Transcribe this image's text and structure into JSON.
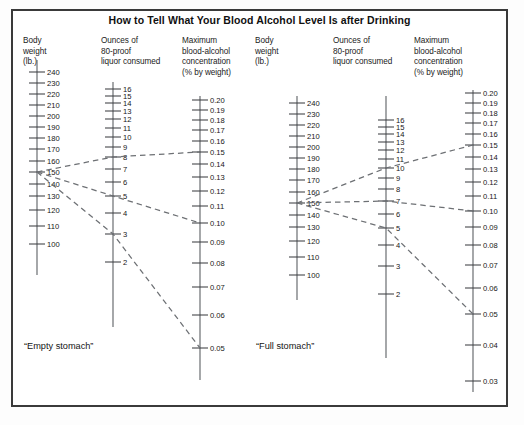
{
  "title": "How to Tell What Your Blood Alcohol Level Is after Drinking",
  "panels": [
    {
      "key": "empty",
      "caption": "“Empty stomach”",
      "columns": [
        {
          "key": "weight",
          "header": "Body\nweight\n(lb.)"
        },
        {
          "key": "ounces",
          "header": "Ounces of\n80-proof\nliquor consumed"
        },
        {
          "key": "bac",
          "header": "Maximum\nblood-alcohol\nconcentration\n(% by weight)"
        }
      ]
    },
    {
      "key": "full",
      "caption": "“Full stomach”",
      "columns": [
        {
          "key": "weight",
          "header": "Body\nweight\n(lb.)"
        },
        {
          "key": "ounces",
          "header": "Ounces of\n80-proof\nliquor consumed"
        },
        {
          "key": "bac",
          "header": "Maximum\nblood-alcohol\nconcentration\n(% by weight)"
        }
      ]
    }
  ],
  "chart_data": {
    "type": "line",
    "chart_subtype": "nomogram",
    "title": "How to Tell What Your Blood Alcohol Level Is after Drinking",
    "xlabel": "",
    "ylabel": "",
    "grid": false,
    "legend": null,
    "panels": [
      {
        "name": "“Empty stomach”",
        "scales": [
          {
            "name": "Body weight (lb.)",
            "unit": "lb.",
            "ticks": [
              240,
              230,
              220,
              210,
              200,
              190,
              180,
              170,
              160,
              150,
              140,
              130,
              120,
              110,
              100
            ],
            "labels": [
              "240",
              "230",
              "220",
              "210",
              "200",
              "190",
              "180",
              "170",
              "160",
              "150",
              "140",
              "130",
              "120",
              "110",
              "100"
            ],
            "range": [
              100,
              240
            ],
            "pivot_value": 150
          },
          {
            "name": "Ounces of 80-proof liquor consumed",
            "unit": "oz",
            "ticks": [
              16,
              15,
              14,
              13,
              12,
              11,
              10,
              9,
              8,
              7,
              6,
              5,
              4,
              3,
              2
            ],
            "labels": [
              "16",
              "15",
              "14",
              "13",
              "12",
              "11",
              "10",
              "9",
              "8",
              "7",
              "6",
              "5",
              "4",
              "3",
              "2"
            ],
            "range": [
              2,
              16
            ]
          },
          {
            "name": "Maximum blood-alcohol concentration (% by weight)",
            "unit": "% by weight",
            "ticks": [
              0.2,
              0.19,
              0.18,
              0.17,
              0.16,
              0.15,
              0.14,
              0.13,
              0.12,
              0.11,
              0.1,
              0.09,
              0.08,
              0.07,
              0.06,
              0.05
            ],
            "labels": [
              "0.20",
              "0.19",
              "0.18",
              "0.17",
              "0.16",
              "0.15",
              "0.14",
              "0.13",
              "0.12",
              "0.11",
              "0.10",
              "0.09",
              "0.08",
              "0.07",
              "0.06",
              "0.05"
            ],
            "range": [
              0.05,
              0.2
            ]
          }
        ],
        "guide_lines": [
          {
            "weight_lb": 150,
            "ounces": 8,
            "bac": 0.15
          },
          {
            "weight_lb": 150,
            "ounces": 5,
            "bac": 0.1
          },
          {
            "weight_lb": 150,
            "ounces": 3,
            "bac": 0.05
          }
        ]
      },
      {
        "name": "“Full stomach”",
        "scales": [
          {
            "name": "Body weight (lb.)",
            "unit": "lb.",
            "ticks": [
              240,
              230,
              220,
              210,
              200,
              190,
              180,
              170,
              160,
              150,
              140,
              130,
              120,
              110,
              100
            ],
            "labels": [
              "240",
              "230",
              "220",
              "210",
              "200",
              "190",
              "180",
              "170",
              "160",
              "150",
              "140",
              "130",
              "120",
              "110",
              "100"
            ],
            "range": [
              100,
              240
            ],
            "pivot_value": 150
          },
          {
            "name": "Ounces of 80-proof liquor consumed",
            "unit": "oz",
            "ticks": [
              16,
              15,
              14,
              13,
              12,
              11,
              10,
              9,
              8,
              7,
              6,
              5,
              4,
              3,
              2
            ],
            "labels": [
              "16",
              "15",
              "14",
              "13",
              "12",
              "11",
              "10",
              "9",
              "8",
              "7",
              "6",
              "5",
              "4",
              "3",
              "2"
            ],
            "range": [
              2,
              16
            ]
          },
          {
            "name": "Maximum blood-alcohol concentration (% by weight)",
            "unit": "% by weight",
            "ticks": [
              0.2,
              0.19,
              0.18,
              0.17,
              0.16,
              0.15,
              0.14,
              0.13,
              0.12,
              0.11,
              0.1,
              0.09,
              0.08,
              0.07,
              0.06,
              0.05,
              0.04,
              0.03
            ],
            "labels": [
              "0.20",
              "0.19",
              "0.18",
              "0.17",
              "0.16",
              "0.15",
              "0.14",
              "0.13",
              "0.12",
              "0.11",
              "0.10",
              "0.09",
              "0.08",
              "0.07",
              "0.06",
              "0.05",
              "0.04",
              "0.03"
            ],
            "range": [
              0.03,
              0.2
            ]
          }
        ],
        "guide_lines": [
          {
            "weight_lb": 150,
            "ounces": 10,
            "bac": 0.15
          },
          {
            "weight_lb": 150,
            "ounces": 7,
            "bac": 0.1
          },
          {
            "weight_lb": 150,
            "ounces": 5,
            "bac": 0.05
          }
        ]
      }
    ]
  },
  "geometry": {
    "panels": [
      {
        "key": "empty",
        "caption_pos": {
          "x": 24,
          "y": 341
        },
        "headers": [
          {
            "x": 23,
            "y": 36
          },
          {
            "x": 101,
            "y": 36
          },
          {
            "x": 182,
            "y": 36
          }
        ],
        "axes": [
          {
            "key": "weight",
            "x": 37,
            "top": 66,
            "bottom": 190,
            "tick_half": 8,
            "label_dx": 10,
            "label_dy": 2.6,
            "values": [
              240,
              230,
              220,
              210,
              200,
              190,
              180,
              170,
              160,
              150,
              140,
              130,
              120,
              110,
              100
            ],
            "ys": [
              72,
              83,
              94,
              105,
              116,
              127,
              138,
              149,
              161,
              172,
              184,
              196,
              210,
              226,
              244
            ],
            "labels": [
              "240",
              "230",
              "220",
              "210",
              "200",
              "190",
              "180",
              "170",
              "160",
              "150",
              "140",
              "130",
              "120",
              "110",
              "100"
            ],
            "axis_top": 60,
            "axis_bottom": 275
          },
          {
            "key": "ounces",
            "x": 113,
            "top": 84,
            "bottom": 330,
            "tick_half": 8,
            "label_dx": 10,
            "label_dy": 2.6,
            "values": [
              16,
              15,
              14,
              13,
              12,
              11,
              10,
              9,
              8,
              7,
              6,
              5,
              4,
              3,
              2
            ],
            "ys": [
              89,
              96,
              103,
              111,
              119,
              128,
              137,
              147,
              157,
              169,
              182,
              196,
              213,
              234,
              262
            ],
            "labels": [
              "16",
              "15",
              "14",
              "13",
              "12",
              "11",
              "10",
              "9",
              "8",
              "7",
              "6",
              "5",
              "4",
              "3",
              "2"
            ],
            "axis_top": 82,
            "axis_bottom": 327
          },
          {
            "key": "bac",
            "x": 200,
            "top": 96,
            "bottom": 400,
            "tick_half": 8,
            "label_dx": 10,
            "label_dy": 2.6,
            "values": [
              0.2,
              0.19,
              0.18,
              0.17,
              0.16,
              0.15,
              0.14,
              0.13,
              0.12,
              0.11,
              0.1,
              0.09,
              0.08,
              0.07,
              0.06,
              0.05
            ],
            "ys": [
              100,
              110,
              120,
              130,
              141,
              152,
              164,
              177,
              191,
              206,
              223,
              242,
              263,
              287,
              315,
              348
            ],
            "labels": [
              "0.20",
              "0.19",
              "0.18",
              "0.17",
              "0.16",
              "0.15",
              "0.14",
              "0.13",
              "0.12",
              "0.11",
              "0.10",
              "0.09",
              "0.08",
              "0.07",
              "0.06",
              "0.05"
            ],
            "axis_top": 96,
            "axis_bottom": 380
          }
        ],
        "guides": [
          {
            "pts": [
              [
                37,
                172
              ],
              [
                113,
                157
              ],
              [
                200,
                152
              ]
            ]
          },
          {
            "pts": [
              [
                37,
                172
              ],
              [
                113,
                196
              ],
              [
                200,
                223
              ]
            ]
          },
          {
            "pts": [
              [
                37,
                172
              ],
              [
                113,
                234
              ],
              [
                200,
                348
              ]
            ]
          }
        ]
      },
      {
        "key": "full",
        "caption_pos": {
          "x": 256,
          "y": 341
        },
        "headers": [
          {
            "x": 255,
            "y": 36
          },
          {
            "x": 333,
            "y": 36
          },
          {
            "x": 414,
            "y": 36
          }
        ],
        "axes": [
          {
            "key": "weight",
            "x": 297,
            "top": 96,
            "bottom": 230,
            "tick_half": 8,
            "label_dx": 10,
            "label_dy": 2.6,
            "values": [
              240,
              230,
              220,
              210,
              200,
              190,
              180,
              170,
              160,
              150,
              140,
              130,
              120,
              110,
              100
            ],
            "ys": [
              103,
              114,
              125,
              136,
              147,
              158,
              169,
              180,
              192,
              203,
              215,
              227,
              241,
              257,
              275
            ],
            "labels": [
              "240",
              "230",
              "220",
              "210",
              "200",
              "190",
              "180",
              "170",
              "160",
              "150",
              "140",
              "130",
              "120",
              "110",
              "100"
            ],
            "axis_top": 96,
            "axis_bottom": 300
          },
          {
            "key": "ounces",
            "x": 386,
            "top": 110,
            "bottom": 360,
            "tick_half": 8,
            "label_dx": 10,
            "label_dy": 2.6,
            "values": [
              16,
              15,
              14,
              13,
              12,
              11,
              10,
              9,
              8,
              7,
              6,
              5,
              4,
              3,
              2
            ],
            "ys": [
              120,
              127,
              134,
              142,
              150,
              159,
              168,
              178,
              189,
              201,
              214,
              228,
              245,
              266,
              294
            ],
            "labels": [
              "16",
              "15",
              "14",
              "13",
              "12",
              "11",
              "10",
              "9",
              "8",
              "7",
              "6",
              "5",
              "4",
              "3",
              "2"
            ],
            "axis_top": 96,
            "axis_bottom": 358
          },
          {
            "key": "bac",
            "x": 473,
            "top": 96,
            "bottom": 400,
            "tick_half": 8,
            "label_dx": 10,
            "label_dy": 2.6,
            "values": [
              0.2,
              0.19,
              0.18,
              0.17,
              0.16,
              0.15,
              0.14,
              0.13,
              0.12,
              0.11,
              0.1,
              0.09,
              0.08,
              0.07,
              0.06,
              0.05,
              0.04,
              0.03
            ],
            "ys": [
              93,
              103,
              113,
              123,
              134,
              145,
              157,
              169,
              182,
              196,
              211,
              227,
              245,
              265,
              288,
              314,
              345,
              381
            ],
            "labels": [
              "0.20",
              "0.19",
              "0.18",
              "0.17",
              "0.16",
              "0.15",
              "0.14",
              "0.13",
              "0.12",
              "0.11",
              "0.10",
              "0.09",
              "0.08",
              "0.07",
              "0.06",
              "0.05",
              "0.04",
              "0.03"
            ],
            "axis_top": 90,
            "axis_bottom": 392
          }
        ],
        "guides": [
          {
            "pts": [
              [
                297,
                203
              ],
              [
                386,
                168
              ],
              [
                473,
                145
              ]
            ]
          },
          {
            "pts": [
              [
                297,
                203
              ],
              [
                386,
                201
              ],
              [
                473,
                211
              ]
            ]
          },
          {
            "pts": [
              [
                297,
                203
              ],
              [
                386,
                228
              ],
              [
                473,
                314
              ]
            ]
          }
        ]
      }
    ]
  }
}
